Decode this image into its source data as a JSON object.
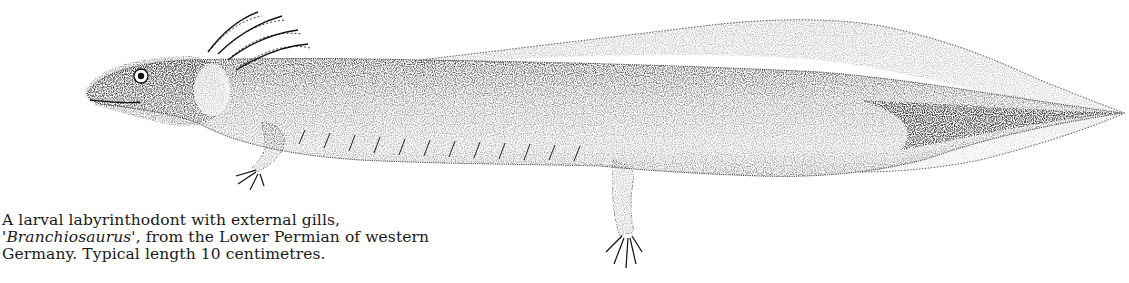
{
  "figure": {
    "style": "stipple ink drawing",
    "ink_color": "#111111",
    "paper_color": "#ffffff"
  },
  "caption": {
    "line1": "A larval labyrinthodont with external gills,",
    "line2_quote_open": "'",
    "line2_taxon": "Branchiosaurus",
    "line2_rest": "', from the Lower Permian of western",
    "line3": "Germany. Typical length 10 centimetres."
  }
}
